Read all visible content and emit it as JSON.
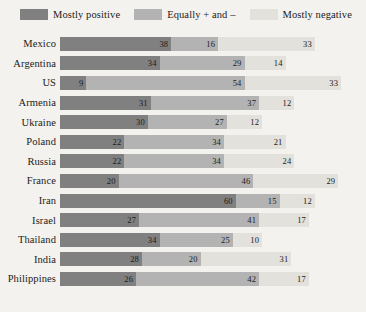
{
  "legend": {
    "items": [
      {
        "label": "Mostly positive",
        "color": "#808080",
        "icon": "legend-swatch-positive"
      },
      {
        "label": "Equally + and –",
        "color": "#b3b3b3",
        "icon": "legend-swatch-mixed"
      },
      {
        "label": "Mostly negative",
        "color": "#e2e1dc",
        "icon": "legend-swatch-negative"
      }
    ]
  },
  "chart_data": {
    "type": "bar",
    "orientation": "horizontal",
    "stacked": true,
    "title": "",
    "subtitle": "",
    "xlabel": "",
    "ylabel": "",
    "xlim": [
      0,
      100
    ],
    "grid": false,
    "legend_position": "top",
    "categories": [
      "Mexico",
      "Argentina",
      "US",
      "Armenia",
      "Ukraine",
      "Poland",
      "Russia",
      "France",
      "Iran",
      "Israel",
      "Thailand",
      "India",
      "Philippines"
    ],
    "series": [
      {
        "name": "Mostly positive",
        "color": "#808080",
        "values": [
          38,
          34,
          9,
          31,
          30,
          22,
          22,
          20,
          60,
          27,
          34,
          28,
          26
        ]
      },
      {
        "name": "Equally + and –",
        "color": "#b3b3b3",
        "values": [
          16,
          29,
          54,
          37,
          27,
          34,
          34,
          46,
          15,
          41,
          25,
          20,
          42
        ]
      },
      {
        "name": "Mostly negative",
        "color": "#e2e1dc",
        "values": [
          33,
          14,
          33,
          12,
          12,
          21,
          24,
          29,
          12,
          17,
          10,
          31,
          17
        ]
      }
    ],
    "rows": [
      {
        "label": "Mexico",
        "values": [
          38,
          16,
          33
        ]
      },
      {
        "label": "Argentina",
        "values": [
          34,
          29,
          14
        ]
      },
      {
        "label": "US",
        "values": [
          9,
          54,
          33
        ]
      },
      {
        "label": "Armenia",
        "values": [
          31,
          37,
          12
        ]
      },
      {
        "label": "Ukraine",
        "values": [
          30,
          27,
          12
        ]
      },
      {
        "label": "Poland",
        "values": [
          22,
          34,
          21
        ]
      },
      {
        "label": "Russia",
        "values": [
          22,
          34,
          24
        ]
      },
      {
        "label": "France",
        "values": [
          20,
          46,
          29
        ]
      },
      {
        "label": "Iran",
        "values": [
          60,
          15,
          12
        ]
      },
      {
        "label": "Israel",
        "values": [
          27,
          41,
          17
        ]
      },
      {
        "label": "Thailand",
        "values": [
          34,
          25,
          10
        ]
      },
      {
        "label": "India",
        "values": [
          28,
          20,
          31
        ]
      },
      {
        "label": "Philippines",
        "values": [
          26,
          42,
          17
        ]
      }
    ]
  }
}
